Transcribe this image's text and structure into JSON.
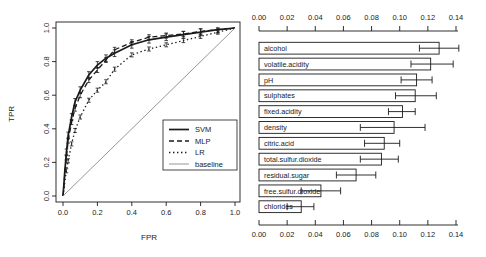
{
  "figure": {
    "background": "#ffffff",
    "foreground": "#1a1a1a",
    "baseline_color": "#8a8a8a"
  },
  "chart_data": [
    {
      "type": "line",
      "title": "",
      "xlabel": "FPR",
      "ylabel": "TPR",
      "xlim": [
        0.0,
        1.0
      ],
      "ylim": [
        0.0,
        1.0
      ],
      "grid": false,
      "xticks": [
        "0.0",
        "0.2",
        "0.4",
        "0.6",
        "0.8",
        "1.0"
      ],
      "yticks": [
        "0.0",
        "0.2",
        "0.4",
        "0.6",
        "0.8",
        "1.0"
      ],
      "legend_position": "inside-right-lower",
      "legend": [
        "SVM",
        "MLP",
        "LR",
        "baseline"
      ],
      "series": [
        {
          "name": "SVM",
          "style": "solid-thick",
          "error": 0.02,
          "x": [
            0,
            0.005,
            0.01,
            0.02,
            0.03,
            0.05,
            0.07,
            0.1,
            0.15,
            0.2,
            0.25,
            0.3,
            0.4,
            0.5,
            0.6,
            0.7,
            0.8,
            0.9,
            1.0
          ],
          "y": [
            0,
            0.07,
            0.14,
            0.26,
            0.36,
            0.47,
            0.56,
            0.63,
            0.72,
            0.78,
            0.82,
            0.85,
            0.9,
            0.93,
            0.945,
            0.96,
            0.975,
            0.99,
            1.0
          ]
        },
        {
          "name": "MLP",
          "style": "dashed",
          "error": 0.015,
          "x": [
            0,
            0.005,
            0.01,
            0.02,
            0.03,
            0.05,
            0.07,
            0.1,
            0.15,
            0.2,
            0.25,
            0.3,
            0.4,
            0.5,
            0.6,
            0.7,
            0.8,
            0.9,
            1.0
          ],
          "y": [
            0,
            0.06,
            0.12,
            0.23,
            0.33,
            0.44,
            0.52,
            0.6,
            0.69,
            0.75,
            0.81,
            0.87,
            0.915,
            0.945,
            0.955,
            0.965,
            0.98,
            0.99,
            1.0
          ]
        },
        {
          "name": "LR",
          "style": "dotted",
          "error": 0.012,
          "x": [
            0,
            0.005,
            0.01,
            0.02,
            0.03,
            0.05,
            0.07,
            0.1,
            0.15,
            0.2,
            0.25,
            0.3,
            0.4,
            0.5,
            0.6,
            0.7,
            0.8,
            0.9,
            1.0
          ],
          "y": [
            0,
            0.04,
            0.08,
            0.15,
            0.21,
            0.31,
            0.39,
            0.47,
            0.57,
            0.63,
            0.68,
            0.755,
            0.84,
            0.875,
            0.9,
            0.925,
            0.95,
            0.975,
            1.0
          ]
        },
        {
          "name": "baseline",
          "style": "solid-thin",
          "x": [
            0,
            1.0
          ],
          "y": [
            0,
            1.0
          ]
        }
      ]
    },
    {
      "type": "bar",
      "orientation": "horizontal",
      "title": "",
      "xlim": [
        0.0,
        0.14
      ],
      "xticks": [
        "0.00",
        "0.02",
        "0.04",
        "0.06",
        "0.08",
        "0.10",
        "0.12",
        "0.14"
      ],
      "categories": [
        "alcohol",
        "volatile.acidity",
        "pH",
        "sulphates",
        "fixed.acidity",
        "density",
        "citric.acid",
        "total.sulfur.dioxide",
        "residual.sugar",
        "free.sulfur.dioxide",
        "chlorides"
      ],
      "values": [
        0.128,
        0.122,
        0.112,
        0.111,
        0.102,
        0.096,
        0.089,
        0.087,
        0.069,
        0.044,
        0.03
      ],
      "error_low": [
        0.114,
        0.108,
        0.101,
        0.097,
        0.092,
        0.072,
        0.075,
        0.072,
        0.055,
        0.03,
        0.02
      ],
      "error_high": [
        0.142,
        0.138,
        0.123,
        0.126,
        0.111,
        0.118,
        0.1,
        0.099,
        0.083,
        0.058,
        0.039
      ]
    }
  ]
}
